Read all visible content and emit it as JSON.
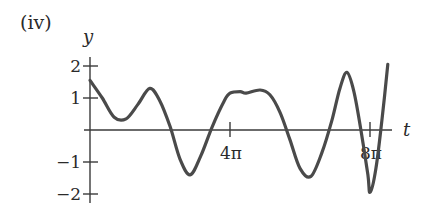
{
  "panel_label": "(iv)",
  "chart_data": {
    "type": "line",
    "title": "(iv)",
    "xlabel": "t",
    "ylabel": "y",
    "x_unit": "pi",
    "xlim": [
      0,
      8.6
    ],
    "ylim": [
      -2.1,
      2.1
    ],
    "grid": false,
    "legend": null,
    "x_ticks": [
      {
        "value": 4,
        "label": "4π"
      },
      {
        "value": 8,
        "label": "8π"
      }
    ],
    "y_ticks": [
      {
        "value": 2,
        "label": "2"
      },
      {
        "value": 1,
        "label": "1"
      },
      {
        "value": -1,
        "label": "−1"
      },
      {
        "value": -2,
        "label": "−2"
      }
    ],
    "series": [
      {
        "name": "y(t)",
        "color": "#4a4a4a",
        "x": [
          0,
          0.35,
          0.69,
          1.03,
          1.37,
          1.71,
          2.0,
          2.29,
          2.57,
          2.86,
          3.17,
          3.49,
          3.83,
          4.0,
          4.29,
          4.46,
          4.86,
          5.14,
          5.43,
          5.71,
          6.0,
          6.31,
          6.63,
          6.91,
          7.14,
          7.34,
          7.54,
          7.74,
          7.94,
          8.0,
          8.17,
          8.34,
          8.51
        ],
        "y": [
          1.55,
          1.0,
          0.4,
          0.35,
          0.8,
          1.3,
          0.9,
          0.1,
          -0.9,
          -1.4,
          -0.8,
          0.1,
          0.9,
          1.15,
          1.2,
          1.15,
          1.25,
          1.1,
          0.55,
          -0.3,
          -1.2,
          -1.45,
          -0.7,
          0.3,
          1.3,
          1.8,
          1.2,
          0.0,
          -1.4,
          -1.95,
          -1.2,
          0.3,
          2.05
        ]
      }
    ]
  }
}
